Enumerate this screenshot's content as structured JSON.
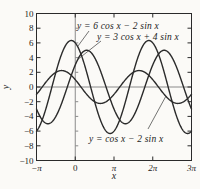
{
  "figure": {
    "background": "#fbfaf7",
    "ink": "#1c1c1c",
    "frame_color": "#2a2a2a",
    "zero_axis_color": "#8a8a8a"
  },
  "chart_data": {
    "type": "line",
    "title": "",
    "xlabel": "x",
    "ylabel": "y",
    "x_unit": "radians (multiples of pi)",
    "xlim_pi": [
      -1,
      3
    ],
    "ylim": [
      -10,
      10
    ],
    "grid": false,
    "legend": "inline-annotations",
    "x_ticks": [
      {
        "value_pi": -1,
        "label": "−π"
      },
      {
        "value_pi": 0,
        "label": "0"
      },
      {
        "value_pi": 1,
        "label": "π"
      },
      {
        "value_pi": 2,
        "label": "2π"
      },
      {
        "value_pi": 3,
        "label": "3π"
      }
    ],
    "y_ticks": [
      {
        "value": 10,
        "label": "10"
      },
      {
        "value": 8,
        "label": "8"
      },
      {
        "value": 6,
        "label": "6"
      },
      {
        "value": 4,
        "label": "4"
      },
      {
        "value": 2,
        "label": "2"
      },
      {
        "value": 0,
        "label": "0"
      },
      {
        "value": -2,
        "label": "−2"
      },
      {
        "value": -4,
        "label": "−4"
      },
      {
        "value": -6,
        "label": "−6"
      },
      {
        "value": -8,
        "label": "−8"
      },
      {
        "value": -10,
        "label": "−10"
      }
    ],
    "series": [
      {
        "label": "y = 6 cos x − 2 sin x",
        "formula": "y = a·cos(x) + b·sin(x)",
        "cos_coeff": 6,
        "sin_coeff": -2,
        "amplitude": 6.32,
        "color": "#2b2b2b"
      },
      {
        "label": "y = 3 cos x + 4 sin x",
        "formula": "y = a·cos(x) + b·sin(x)",
        "cos_coeff": 3,
        "sin_coeff": 4,
        "amplitude": 5,
        "color": "#2b2b2b"
      },
      {
        "label": "y = cos x − 2 sin x",
        "formula": "y = a·cos(x) + b·sin(x)",
        "cos_coeff": 1,
        "sin_coeff": -2,
        "amplitude": 2.24,
        "color": "#2b2b2b"
      }
    ]
  }
}
